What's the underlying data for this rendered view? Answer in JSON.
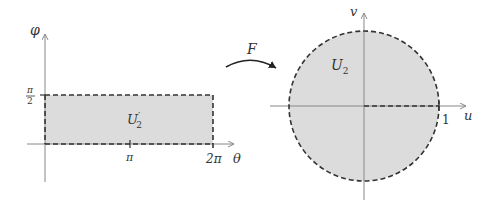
{
  "left_diagram": {
    "region_label": "U",
    "region_label_prime": "′",
    "region_label_sub": "2",
    "vertical_axis_label": "φ",
    "horizontal_axis_label": "θ",
    "y_tick_label_numer": "π",
    "y_tick_label_denom": "2",
    "x_tick_pi": "π",
    "x_tick_2pi": "2π"
  },
  "mapping": {
    "label": "F"
  },
  "right_diagram": {
    "region_label": "U",
    "region_label_sub": "2",
    "vertical_axis_label": "v",
    "horizontal_axis_label": "u",
    "unit_label": "1"
  },
  "colors": {
    "fill": "#dcdcdc",
    "axis": "#888888",
    "dash": "#333333",
    "text": "#333333"
  }
}
